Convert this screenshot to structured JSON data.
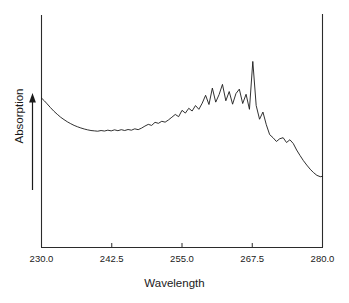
{
  "chart_data": {
    "type": "line",
    "title": "",
    "xlabel": "Wavelength",
    "ylabel": "Absorption",
    "xlim": [
      230.0,
      280.0
    ],
    "ylim": [
      0,
      1
    ],
    "grid": false,
    "legend": null,
    "xticks": [
      230.0,
      242.5,
      255.0,
      267.5,
      280.0
    ],
    "xtick_labels": [
      "230.0",
      "242.5",
      "255.0",
      "267.5",
      "280.0"
    ],
    "yticks": [],
    "ytick_labels": [],
    "axis_style": "left-bottom-right-spines",
    "line_color": "#1a1a1a",
    "line_width": 0.9,
    "y_axis_arrow": true,
    "annotations": [],
    "series": [
      {
        "name": "Absorption spectrum",
        "x": [
          230.0,
          230.5,
          231.0,
          231.6,
          232.2,
          232.8,
          233.4,
          234.0,
          234.6,
          235.2,
          235.8,
          236.4,
          237.0,
          237.6,
          238.2,
          238.8,
          239.4,
          240.0,
          240.6,
          241.2,
          241.8,
          242.4,
          243.0,
          243.6,
          244.2,
          244.8,
          245.4,
          246.0,
          246.6,
          247.2,
          247.8,
          248.4,
          249.0,
          249.6,
          250.2,
          250.8,
          251.4,
          252.0,
          252.6,
          253.2,
          253.8,
          254.4,
          255.0,
          255.6,
          256.2,
          256.8,
          257.4,
          258.0,
          258.6,
          259.2,
          259.8,
          260.4,
          261.0,
          261.6,
          262.2,
          262.8,
          263.4,
          264.0,
          264.6,
          265.2,
          265.8,
          266.4,
          267.0,
          267.6,
          268.2,
          268.8,
          269.4,
          270.0,
          270.6,
          271.2,
          271.8,
          272.4,
          273.0,
          273.6,
          274.2,
          274.8,
          275.4,
          276.0,
          276.6,
          277.2,
          277.8,
          278.4,
          279.0,
          279.6,
          280.0
        ],
        "y": [
          0.684,
          0.668,
          0.65,
          0.628,
          0.607,
          0.589,
          0.572,
          0.558,
          0.545,
          0.534,
          0.524,
          0.516,
          0.509,
          0.503,
          0.498,
          0.494,
          0.492,
          0.49,
          0.494,
          0.491,
          0.496,
          0.492,
          0.498,
          0.493,
          0.499,
          0.494,
          0.5,
          0.496,
          0.504,
          0.499,
          0.508,
          0.52,
          0.53,
          0.524,
          0.542,
          0.536,
          0.548,
          0.543,
          0.556,
          0.572,
          0.588,
          0.575,
          0.612,
          0.596,
          0.624,
          0.608,
          0.64,
          0.618,
          0.654,
          0.7,
          0.646,
          0.742,
          0.66,
          0.704,
          0.764,
          0.668,
          0.722,
          0.648,
          0.71,
          0.736,
          0.652,
          0.706,
          0.618,
          0.898,
          0.64,
          0.56,
          0.602,
          0.528,
          0.47,
          0.452,
          0.43,
          0.446,
          0.452,
          0.424,
          0.44,
          0.418,
          0.38,
          0.348,
          0.318,
          0.292,
          0.268,
          0.248,
          0.232,
          0.224,
          0.226
        ]
      }
    ]
  },
  "axes": {
    "x_start_label": "230.0",
    "x_end_label": "280.0"
  }
}
